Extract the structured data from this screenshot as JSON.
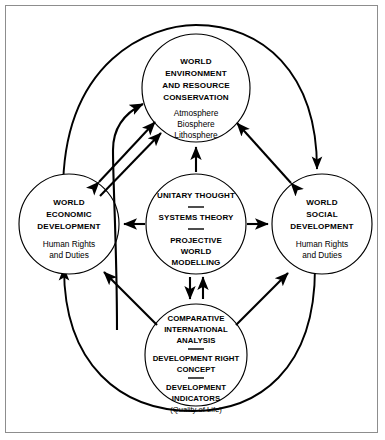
{
  "figure": {
    "border_color": "#8d8d8d",
    "line_color": "#000000",
    "background": "#ffffff"
  },
  "nodes": {
    "environment": {
      "id": "world-environment",
      "heading": [
        "WORLD",
        "ENVIRONMENT",
        "AND RESOURCE",
        "CONSERVATION"
      ],
      "items": [
        "Atmosphere",
        "Biosphere",
        "Lithosphere"
      ]
    },
    "economic": {
      "id": "world-economic",
      "heading": [
        "WORLD",
        "ECONOMIC",
        "DEVELOPMENT"
      ],
      "items": [
        "Human Rights",
        "and Duties"
      ]
    },
    "social": {
      "id": "world-social",
      "heading": [
        "WORLD",
        "SOCIAL",
        "DEVELOPMENT"
      ],
      "items": [
        "Human Rights",
        "and Duties"
      ]
    },
    "core": {
      "id": "unitary-core",
      "lines": [
        "UNITARY THOUGHT",
        "SYSTEMS THEORY",
        "PROJECTIVE",
        "WORLD",
        "MODELLING"
      ]
    },
    "analysis": {
      "id": "comparative-analysis",
      "group_one": [
        "COMPARATIVE",
        "INTERNATIONAL",
        "ANALYSIS"
      ],
      "group_two": [
        "DEVELOPMENT RIGHT",
        "CONCEPT"
      ],
      "group_three": [
        "DEVELOPMENT",
        "INDICATORS"
      ],
      "note": "(Quality of Life)"
    }
  },
  "connectors": {
    "core_to_environment": "arrow-up",
    "core_to_economic": "arrow-left",
    "core_to_social": "arrow-right",
    "core_to_analysis": "double-arrow-vertical",
    "economic_to_environment": "double-arrow-diagonal",
    "social_to_environment": "double-arrow-diagonal",
    "analysis_to_environment": "curved-arrow-up",
    "analysis_to_economic": "arrow-diagonal",
    "analysis_to_social": "arrow-diagonal",
    "outer_loop_left": "economic-to-environment-outer",
    "outer_loop_right": "environment-to-social-outer"
  }
}
